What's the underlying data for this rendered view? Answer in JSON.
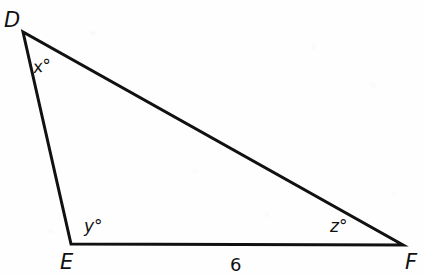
{
  "figure": {
    "kind": "triangle-geometry-diagram",
    "background_color": "#fefefe",
    "stroke_color": "#111111",
    "stroke_width": 3,
    "vertices": [
      {
        "name": "D",
        "label": "D",
        "x": 23,
        "y": 32
      },
      {
        "name": "E",
        "label": "E",
        "x": 71,
        "y": 244
      },
      {
        "name": "F",
        "label": "F",
        "x": 403,
        "y": 245
      }
    ],
    "angle_labels": [
      {
        "name": "angle-D",
        "label": "x°",
        "at_vertex": "D"
      },
      {
        "name": "angle-E",
        "label": "y°",
        "at_vertex": "E"
      },
      {
        "name": "angle-F",
        "label": "z°",
        "at_vertex": "F"
      }
    ],
    "side_labels": [
      {
        "name": "side-EF",
        "label": "6",
        "between": "E-F"
      }
    ]
  }
}
